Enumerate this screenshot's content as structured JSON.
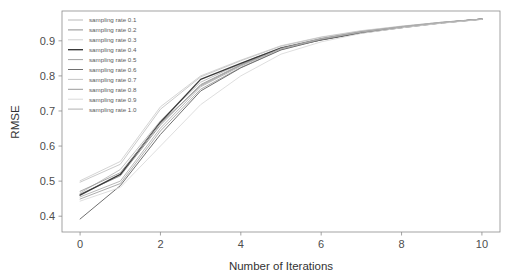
{
  "chart_data": {
    "type": "line",
    "title": "",
    "xlabel": "Number of Iterations",
    "ylabel": "RMSE",
    "xlim": [
      -0.45,
      10.45
    ],
    "ylim": [
      0.355,
      0.985
    ],
    "xticks": [
      0,
      2,
      4,
      6,
      8,
      10
    ],
    "xticklabels": [
      "0",
      "2",
      "4",
      "6",
      "8",
      "10"
    ],
    "yticks": [
      0.4,
      0.5,
      0.6,
      0.7,
      0.8,
      0.9
    ],
    "yticklabels": [
      "0.4",
      "0.5",
      "0.6",
      "0.7",
      "0.8",
      "0.9"
    ],
    "grid": false,
    "legend_position": "upper left",
    "x": [
      0,
      1,
      2,
      3,
      4,
      5,
      6,
      7,
      8,
      9,
      10
    ],
    "series": [
      {
        "name": "sampling rate 0.1",
        "color": "#b9b9b9",
        "width": 0.9,
        "values": [
          0.466,
          0.533,
          0.672,
          0.782,
          0.835,
          0.881,
          0.907,
          0.927,
          0.941,
          0.953,
          0.962
        ]
      },
      {
        "name": "sampling rate 0.2",
        "color": "#8f8f8f",
        "width": 0.9,
        "values": [
          0.463,
          0.515,
          0.66,
          0.775,
          0.832,
          0.879,
          0.906,
          0.926,
          0.94,
          0.952,
          0.962
        ]
      },
      {
        "name": "sampling rate 0.3",
        "color": "#cfcfcf",
        "width": 0.9,
        "values": [
          0.501,
          0.556,
          0.712,
          0.8,
          0.845,
          0.886,
          0.911,
          0.929,
          0.942,
          0.953,
          0.962
        ]
      },
      {
        "name": "sampling rate 0.4",
        "color": "#3a3a3a",
        "width": 1.35,
        "values": [
          0.46,
          0.519,
          0.668,
          0.79,
          0.836,
          0.879,
          0.903,
          0.923,
          0.938,
          0.951,
          0.962
        ]
      },
      {
        "name": "sampling rate 0.5",
        "color": "#a3a3a3",
        "width": 0.9,
        "values": [
          0.449,
          0.493,
          0.643,
          0.762,
          0.824,
          0.875,
          0.904,
          0.925,
          0.94,
          0.952,
          0.962
        ]
      },
      {
        "name": "sampling rate 0.6",
        "color": "#707070",
        "width": 1.0,
        "values": [
          0.392,
          0.487,
          0.633,
          0.757,
          0.823,
          0.874,
          0.903,
          0.924,
          0.939,
          0.951,
          0.962
        ]
      },
      {
        "name": "sampling rate 0.7",
        "color": "#c4c4c4",
        "width": 0.9,
        "values": [
          0.497,
          0.548,
          0.705,
          0.797,
          0.843,
          0.885,
          0.91,
          0.928,
          0.941,
          0.953,
          0.962
        ]
      },
      {
        "name": "sampling rate 0.8",
        "color": "#9a9a9a",
        "width": 0.9,
        "values": [
          0.471,
          0.524,
          0.665,
          0.772,
          0.83,
          0.878,
          0.906,
          0.926,
          0.94,
          0.952,
          0.962
        ]
      },
      {
        "name": "sampling rate 0.9",
        "color": "#dadada",
        "width": 0.9,
        "values": [
          0.443,
          0.482,
          0.6,
          0.718,
          0.8,
          0.862,
          0.897,
          0.921,
          0.937,
          0.95,
          0.961
        ]
      },
      {
        "name": "sampling rate 1.0",
        "color": "#b0b0b0",
        "width": 0.9,
        "values": [
          0.455,
          0.5,
          0.651,
          0.769,
          0.828,
          0.877,
          0.905,
          0.925,
          0.94,
          0.952,
          0.962
        ]
      }
    ]
  },
  "axes": {
    "frame_color": "#8c8c8c",
    "tick_color": "#8c8c8c",
    "label_color": "#333333"
  }
}
